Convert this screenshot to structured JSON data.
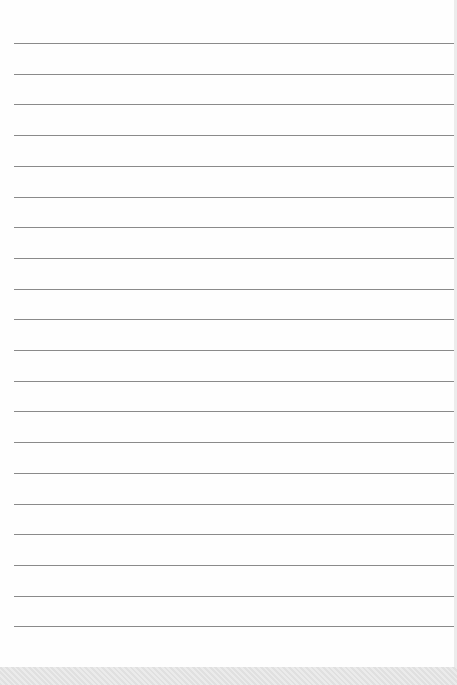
{
  "document": {
    "type": "lined-paper",
    "line_count": 20,
    "first_line_y": 43,
    "line_spacing": 30.7,
    "line_color": "#8a8a8a",
    "paper_color": "#fefefe"
  }
}
